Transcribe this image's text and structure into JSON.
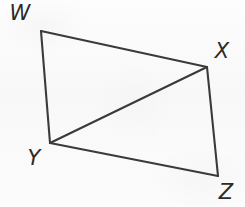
{
  "figure": {
    "name": "quadrilateral-wxyz-with-diagonal",
    "caption": "",
    "background_color": "#fbfbfb",
    "stroke_color": "#3a3a3a",
    "label_color": "#2b2b2b",
    "stroke_width": 2.1,
    "width": 245,
    "height": 207
  },
  "vertices": [
    {
      "id": "W",
      "label": "W",
      "x": 41,
      "y": 31,
      "label_x": 20,
      "label_y": 13
    },
    {
      "id": "X",
      "label": "X",
      "x": 207,
      "y": 67,
      "label_x": 222,
      "label_y": 51
    },
    {
      "id": "Y",
      "label": "Y",
      "x": 50,
      "y": 143,
      "label_x": 34,
      "label_y": 158
    },
    {
      "id": "Z",
      "label": "Z",
      "x": 218,
      "y": 176,
      "label_x": 226,
      "label_y": 192
    }
  ],
  "edges": [
    {
      "id": "WX",
      "from": "W",
      "to": "X",
      "kind": "side"
    },
    {
      "id": "XZ",
      "from": "X",
      "to": "Z",
      "kind": "side"
    },
    {
      "id": "ZY",
      "from": "Z",
      "to": "Y",
      "kind": "side"
    },
    {
      "id": "YW",
      "from": "Y",
      "to": "W",
      "kind": "side"
    },
    {
      "id": "YX",
      "from": "Y",
      "to": "X",
      "kind": "diagonal"
    }
  ]
}
